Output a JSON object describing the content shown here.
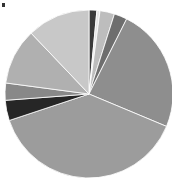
{
  "chart_data": {
    "type": "pie",
    "title": "",
    "legend": [],
    "start_angle_deg": 0,
    "direction": "clockwise",
    "center": [
      89,
      94
    ],
    "radius": 84,
    "slices": [
      {
        "label": "",
        "value": 1.5,
        "color": "#3a3a3a"
      },
      {
        "label": "",
        "value": 0.6,
        "color": "#e6e6e6"
      },
      {
        "label": "",
        "value": 2.8,
        "color": "#bdbdbd"
      },
      {
        "label": "",
        "value": 2.5,
        "color": "#6e6e6e"
      },
      {
        "label": "",
        "value": 23.9,
        "color": "#8e8e8e"
      },
      {
        "label": "",
        "value": 38.6,
        "color": "#9c9c9c"
      },
      {
        "label": "",
        "value": 3.9,
        "color": "#262626"
      },
      {
        "label": "",
        "value": 3.3,
        "color": "#888888"
      },
      {
        "label": "",
        "value": 10.8,
        "color": "#b0b0b0"
      },
      {
        "label": "",
        "value": 12.1,
        "color": "#c8c8c8"
      }
    ]
  }
}
